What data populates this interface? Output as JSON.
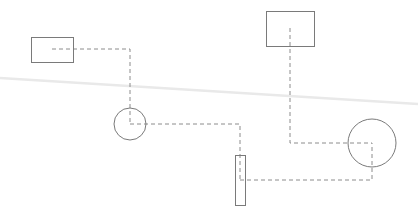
{
  "diagram": {
    "width": 418,
    "height": 215,
    "background": "#ffffff",
    "colors": {
      "shape_stroke": "#7a7a7a",
      "connector_stroke": "#8c8c8c",
      "artifact_stroke": "#e9e9e9"
    },
    "nodes": [
      {
        "id": "rect-small",
        "type": "rect",
        "x": 31,
        "y": 37,
        "width": 42,
        "height": 25
      },
      {
        "id": "circle-left",
        "type": "circle",
        "cx": 130,
        "cy": 124,
        "r": 16
      },
      {
        "id": "rect-narrow",
        "type": "rect",
        "x": 235,
        "y": 155,
        "width": 10,
        "height": 50
      },
      {
        "id": "rect-large",
        "type": "rect",
        "x": 266,
        "y": 11,
        "width": 48,
        "height": 35
      },
      {
        "id": "circle-right",
        "type": "circle",
        "cx": 372,
        "cy": 143,
        "r": 24
      }
    ],
    "edges": [
      {
        "id": "edge-rect-small-to-circle-left",
        "from": "rect-small",
        "to": "circle-left",
        "points": [
          [
            52,
            49
          ],
          [
            130,
            49
          ],
          [
            130,
            124
          ]
        ],
        "style": "dashed"
      },
      {
        "id": "edge-circle-left-to-rect-narrow",
        "from": "circle-left",
        "to": "rect-narrow",
        "points": [
          [
            130,
            124
          ],
          [
            240,
            124
          ],
          [
            240,
            180
          ]
        ],
        "style": "dashed"
      },
      {
        "id": "edge-rect-narrow-to-circle-right",
        "from": "rect-narrow",
        "to": "circle-right",
        "points": [
          [
            240,
            180
          ],
          [
            372,
            180
          ],
          [
            372,
            143
          ]
        ],
        "style": "dashed"
      },
      {
        "id": "edge-rect-large-to-circle-right",
        "from": "rect-large",
        "to": "circle-right",
        "points": [
          [
            290,
            28
          ],
          [
            290,
            143
          ],
          [
            372,
            143
          ]
        ],
        "style": "dashed"
      }
    ],
    "artifacts": [
      {
        "id": "faint-diagonal-line",
        "x1": 0,
        "y1": 78,
        "x2": 418,
        "y2": 104
      }
    ]
  }
}
